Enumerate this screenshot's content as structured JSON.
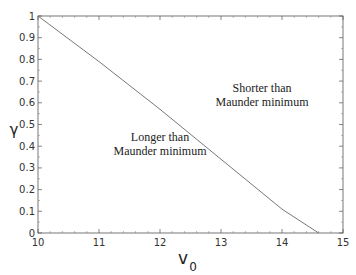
{
  "chart_data": {
    "type": "line",
    "title": "",
    "xlabel": "v_0",
    "ylabel": "γ",
    "xlim": [
      10,
      15
    ],
    "ylim": [
      0,
      1
    ],
    "grid": false,
    "x_ticks": [
      10,
      11,
      12,
      13,
      14,
      15
    ],
    "y_ticks": [
      0,
      0.1,
      0.2,
      0.3,
      0.4,
      0.5,
      0.6,
      0.7,
      0.8,
      0.9,
      1
    ],
    "series": [
      {
        "name": "boundary",
        "x": [
          10,
          11,
          12,
          13,
          14,
          14.6
        ],
        "y": [
          1.0,
          0.79,
          0.57,
          0.34,
          0.11,
          0.0
        ]
      }
    ],
    "annotations": [
      {
        "text_lines": [
          "Shorter than",
          "Maunder minimum"
        ],
        "x": 13.3,
        "y": 0.58
      },
      {
        "text_lines": [
          "Longer than",
          "Maunder minimum"
        ],
        "x": 12.1,
        "y": 0.43
      }
    ]
  },
  "labels": {
    "xlabel_main": "v",
    "xlabel_sub": "0",
    "ylabel": "γ",
    "annot_upper_1": "Shorter than",
    "annot_upper_2": "Maunder minimum",
    "annot_lower_1": "Longer than",
    "annot_lower_2": "Maunder minimum"
  }
}
